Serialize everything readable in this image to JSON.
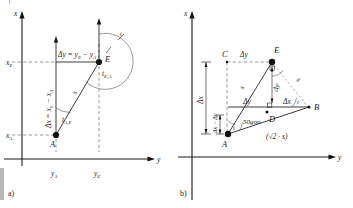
{
  "figure": {
    "title_semantic": "coordinate-differences-and-bearing-diagram",
    "panels": [
      {
        "id": "a",
        "tag": "a)",
        "axes": {
          "x": "x",
          "y": "y"
        },
        "points": [
          {
            "name": "A",
            "label": "A"
          },
          {
            "name": "E",
            "label": "E"
          }
        ],
        "tick_labels": {
          "x_lower": "x",
          "x_lower_sub": "A",
          "x_upper": "x",
          "x_upper_sub": "E",
          "y_left": "y",
          "y_left_sub": "A",
          "y_right": "y",
          "y_right_sub": "E"
        },
        "annotations": {
          "delta_y": "Δy = y",
          "delta_y_sub1": "E",
          "delta_y_mid": " − y",
          "delta_y_sub2": "A",
          "delta_x": "Δx = x",
          "delta_x_sub1": "E",
          "delta_x_mid": " − x",
          "delta_x_sub2": "A",
          "distance": "s",
          "bearing_ae": "t",
          "bearing_ae_sub": "A,E",
          "bearing_ea": "t",
          "bearing_ea_sub": "E,A",
          "arc_t": "t"
        }
      },
      {
        "id": "b",
        "tag": "b)",
        "axes": {
          "x": "x",
          "y": "y"
        },
        "points": [
          {
            "name": "A",
            "label": "A"
          },
          {
            "name": "B",
            "label": "B"
          },
          {
            "name": "C",
            "label": "C"
          },
          {
            "name": "D",
            "label": "D"
          },
          {
            "name": "E",
            "label": "E"
          }
        ],
        "annotations": {
          "delta_y_top": "Δy",
          "delta_y_mid": "Δy",
          "delta_y_lower": "Δy",
          "delta_x_left": "Δx",
          "delta_x_diff": "Δx − Δy",
          "delta_x_right": "Δx",
          "s_ae": "s",
          "s_eb": "s",
          "angle_gon": "50gon",
          "hypotenuse": "(√2 · s)",
          "angle_t_at_a": "t",
          "angle_t_at_b": "t"
        }
      }
    ],
    "colors": {
      "ink": "#1a1a1a",
      "dash": "#555555",
      "background": "#ffffff",
      "edge_mark": "#b8b8b8"
    }
  }
}
